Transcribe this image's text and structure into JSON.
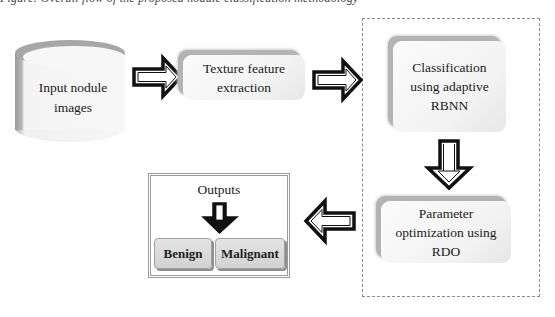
{
  "caption_partial": "Figure: Overall flow of the proposed nodule classification methodology",
  "nodes": {
    "input": {
      "label_line1": "Input nodule",
      "label_line2": "images",
      "shape": "cylinder"
    },
    "texture": {
      "label_line1": "Texture feature",
      "label_line2": "extraction",
      "shape": "rounded-box"
    },
    "classification": {
      "label_line1": "Classification",
      "label_line2": "using adaptive",
      "label_line3": "RBNN",
      "shape": "rounded-box"
    },
    "parameter": {
      "label_line1": "Parameter",
      "label_line2": "optimization using",
      "label_line3": "RDO",
      "shape": "rounded-box"
    },
    "outputs": {
      "title": "Outputs",
      "classes": [
        "Benign",
        "Malignant"
      ]
    }
  },
  "edges": [
    {
      "from": "input",
      "to": "texture",
      "direction": "right"
    },
    {
      "from": "texture",
      "to": "classification",
      "direction": "right"
    },
    {
      "from": "classification",
      "to": "parameter",
      "direction": "down"
    },
    {
      "from": "parameter",
      "to": "outputs",
      "direction": "left"
    },
    {
      "from": "outputs.title",
      "to": "outputs.classes",
      "direction": "down"
    }
  ],
  "group": {
    "style": "dashed",
    "members": [
      "classification",
      "parameter"
    ]
  },
  "colors": {
    "card_shadow": "#b3b3b3",
    "arrow_outline": "#111111",
    "dashed_border": "#8a8a8a",
    "button_fill": "#d9d9d9"
  }
}
